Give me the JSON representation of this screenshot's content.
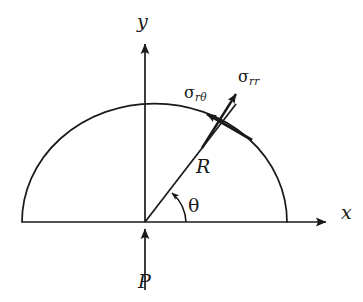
{
  "figure": {
    "kind": "engineering-diagram"
  },
  "labels": {
    "y_axis": "y",
    "x_axis": "x",
    "radius": "R",
    "angle": "θ",
    "load": "P",
    "sigma_symbol": "σ",
    "sigma_rtheta_sub": "rθ",
    "sigma_rr_sub": "rr",
    "sigma_rtheta_full": "σrθ",
    "sigma_rr_full": "σrr"
  },
  "geometry": {
    "origin": {
      "x": 145,
      "y": 222
    },
    "semicircle": {
      "center_x": 154,
      "baseline_y": 222,
      "radius_x": 132,
      "radius_y": 118,
      "left_x": 22,
      "right_x": 287,
      "apex_y": 104
    },
    "x_axis": {
      "x1": 22,
      "y1": 222,
      "x2": 332,
      "y2": 222
    },
    "y_axis": {
      "x1": 145,
      "y1": 222,
      "x2": 145,
      "y2": 38
    },
    "load_arrow": {
      "x1": 145,
      "y1": 290,
      "x2": 145,
      "y2": 224
    },
    "radius_line": {
      "x1": 145,
      "y1": 222,
      "x2": 222,
      "y2": 122
    },
    "arc_point": {
      "x": 222,
      "y": 122
    },
    "sigma_rr_arrow": {
      "x1": 204,
      "y1": 146,
      "x2": 240,
      "y2": 88
    },
    "sigma_rtheta_arrow": {
      "x1": 250,
      "y1": 139,
      "x2": 202,
      "y2": 112
    },
    "theta_arc": {
      "start_x": 184,
      "start_y": 222,
      "end_x": 171,
      "end_y": 196
    },
    "theta_degrees": 52
  },
  "colors": {
    "background": "#ffffff",
    "stroke": "#1a1a1a",
    "text": "#1a1a1a"
  },
  "positions": {
    "y_label": {
      "left": 137,
      "top": 12
    },
    "x_label": {
      "left": 341,
      "top": 203
    },
    "R_label": {
      "left": 196,
      "top": 157
    },
    "theta_label": {
      "left": 188,
      "top": 196
    },
    "P_label": {
      "left": 138,
      "top": 272
    },
    "sigma_rtheta_label": {
      "left": 184,
      "top": 85
    },
    "sigma_rr_label": {
      "left": 238,
      "top": 69
    }
  }
}
